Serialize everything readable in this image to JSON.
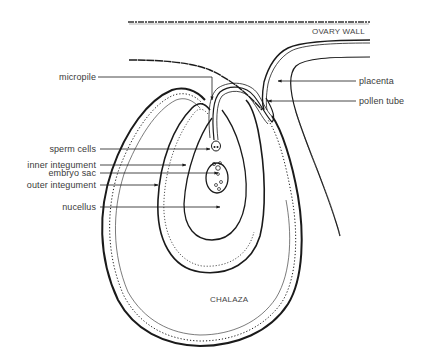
{
  "diagram": {
    "region_labels": {
      "ovary_wall": "OVARY WALL",
      "chalaza": "CHALAZA"
    },
    "left_labels": [
      {
        "id": "micropile",
        "text": "micropile"
      },
      {
        "id": "sperm-cells",
        "text": "sperm cells"
      },
      {
        "id": "inner-integument",
        "text": "inner integument"
      },
      {
        "id": "embryo-sac",
        "text": "embryo sac"
      },
      {
        "id": "outer-integument",
        "text": "outer integument"
      },
      {
        "id": "nucellus",
        "text": "nucellus"
      }
    ],
    "right_labels": [
      {
        "id": "placenta",
        "text": "placenta"
      },
      {
        "id": "pollen-tube",
        "text": "pollen tube"
      }
    ],
    "colors": {
      "line": "#1a1a1a",
      "label_text": "#3a3a3a",
      "background": "#ffffff"
    }
  }
}
